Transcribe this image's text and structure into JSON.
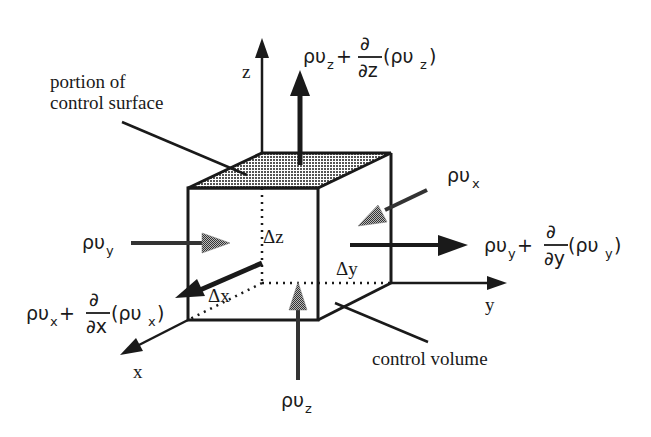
{
  "diagram": {
    "type": "control-volume-mass-flux",
    "colors": {
      "ink": "#1a1a1a",
      "shade": "#9a9a9a",
      "background": "#ffffff"
    },
    "axes": {
      "x": "x",
      "y": "y",
      "z": "z"
    },
    "dimensions": {
      "dx": "Δx",
      "dy": "Δy",
      "dz": "Δz"
    },
    "labels": {
      "surface_line1": "portion of",
      "surface_line2": "control surface",
      "volume": "control volume"
    },
    "fluxes": {
      "in_x": {
        "base": "ρυ",
        "sub": "x"
      },
      "in_y": {
        "base": "ρυ",
        "sub": "y"
      },
      "in_z": {
        "base": "ρυ",
        "sub": "z"
      },
      "out_x": {
        "base": "ρυ",
        "sub": "x",
        "plus": "+",
        "partial": "∂",
        "den": "∂x",
        "paren_open": "(ρυ",
        "paren_close": ")"
      },
      "out_y": {
        "base": "ρυ",
        "sub": "y",
        "plus": "+",
        "partial": "∂",
        "den": "∂y",
        "paren_open": "(ρυ",
        "paren_close": ")"
      },
      "out_z": {
        "base": "ρυ",
        "sub": "z",
        "plus": "+",
        "partial": "∂",
        "den": "∂z",
        "paren_open": "(ρυ",
        "paren_close": ")"
      }
    }
  }
}
